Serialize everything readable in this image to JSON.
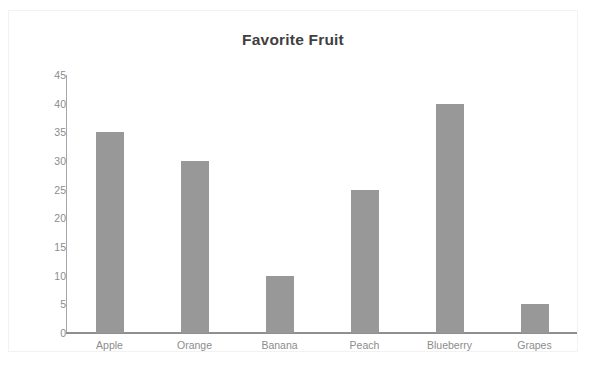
{
  "chart_data": {
    "type": "bar",
    "title": "Favorite Fruit",
    "xlabel": "",
    "ylabel": "",
    "categories": [
      "Apple",
      "Orange",
      "Banana",
      "Peach",
      "Blueberry",
      "Grapes"
    ],
    "values": [
      35,
      30,
      10,
      25,
      40,
      5
    ],
    "ylim": [
      0,
      45
    ],
    "ytick_step": 5,
    "yticks": [
      45,
      40,
      35,
      30,
      25,
      20,
      15,
      10,
      5,
      0
    ],
    "grid": false,
    "legend": null,
    "colors": {
      "bar": "#989898",
      "axis": "#8f8f8f",
      "tick_label": "#8c8c8c",
      "title": "#3f3f3f",
      "background": "#ffffff",
      "frame_border": "#f2f2f2"
    }
  }
}
